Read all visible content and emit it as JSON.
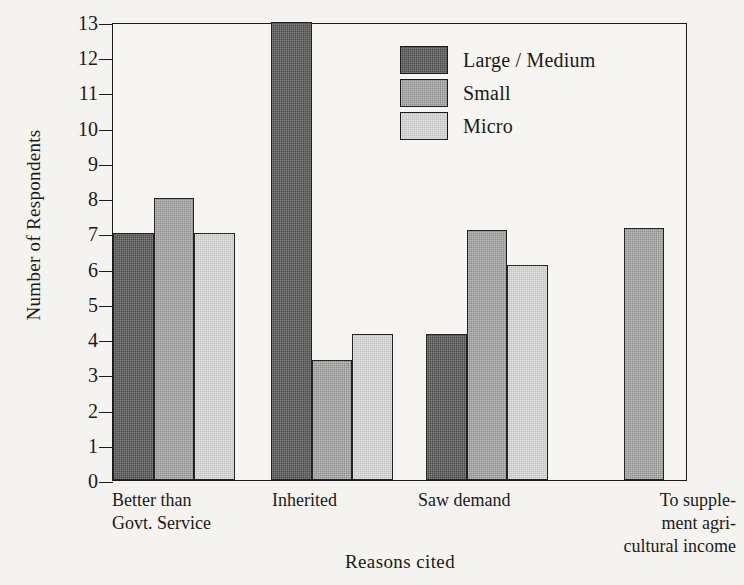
{
  "chart_data": {
    "type": "bar",
    "title": "",
    "xlabel": "Reasons cited",
    "ylabel": "Number of Respondents",
    "ylim": [
      0,
      13
    ],
    "yticks": [
      0,
      1,
      2,
      3,
      4,
      5,
      6,
      7,
      8,
      9,
      10,
      11,
      12,
      13
    ],
    "grid": false,
    "legend_position": "inside-top-center",
    "categories": [
      "Better than Govt. Service",
      "Inherited",
      "Saw demand",
      "To supplement agricultural income"
    ],
    "category_label_lines": [
      [
        "Better than",
        "Govt. Service"
      ],
      [
        "Inherited"
      ],
      [
        "Saw demand"
      ],
      [
        "To supple-",
        "ment agri-",
        "cultural income"
      ]
    ],
    "series": [
      {
        "name": "Large / Medium",
        "color": "#4a4a4a",
        "values": [
          7.0,
          13.0,
          4.15,
          0
        ]
      },
      {
        "name": "Small",
        "color": "#8e8e8e",
        "values": [
          8.0,
          3.4,
          7.1,
          7.15
        ]
      },
      {
        "name": "Micro",
        "color": "#c2c2c2",
        "values": [
          7.0,
          4.15,
          6.1,
          0
        ]
      }
    ]
  },
  "legend": {
    "items": [
      {
        "label": "Large / Medium",
        "swatch": "sw-large"
      },
      {
        "label": "Small",
        "swatch": "sw-small"
      },
      {
        "label": "Micro",
        "swatch": "sw-micro"
      }
    ]
  }
}
